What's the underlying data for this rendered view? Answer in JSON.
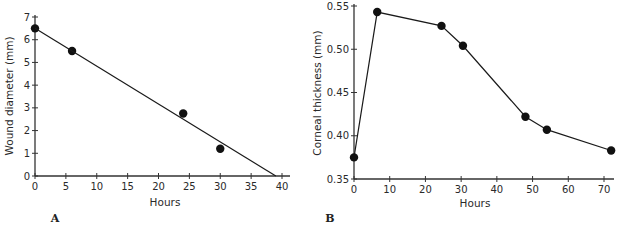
{
  "chart_data": [
    {
      "panel": "A",
      "type": "scatter",
      "title": "",
      "xlabel": "Hours",
      "ylabel": "Wound diameter (mm)",
      "xlim": [
        0,
        40
      ],
      "ylim": [
        0,
        7
      ],
      "xticks": [
        0,
        5,
        10,
        15,
        20,
        25,
        30,
        35,
        40
      ],
      "yticks": [
        0,
        1,
        2,
        3,
        4,
        5,
        6,
        7
      ],
      "grid": false,
      "series": [
        {
          "name": "Measured",
          "style": "points",
          "x": [
            0,
            6,
            24,
            30
          ],
          "y": [
            6.5,
            5.5,
            2.75,
            1.2
          ]
        },
        {
          "name": "Linear fit",
          "style": "line",
          "x": [
            0,
            39
          ],
          "y": [
            6.5,
            0
          ]
        }
      ]
    },
    {
      "panel": "B",
      "type": "line",
      "title": "",
      "xlabel": "Hours",
      "ylabel": "Corneal thickness (mm)",
      "xlim": [
        0,
        70
      ],
      "ylim": [
        0.35,
        0.55
      ],
      "xticks": [
        0,
        10,
        20,
        30,
        40,
        50,
        60,
        70
      ],
      "ytick_labels": [
        "0.35",
        "0.40",
        "0.45",
        "0.50",
        "0.55"
      ],
      "yticks": [
        0.35,
        0.4,
        0.45,
        0.5,
        0.55
      ],
      "grid": false,
      "series": [
        {
          "name": "Corneal thickness",
          "style": "line+points",
          "x": [
            0,
            6.5,
            24.5,
            30.5,
            48,
            54,
            72
          ],
          "y": [
            0.375,
            0.543,
            0.527,
            0.504,
            0.422,
            0.407,
            0.383
          ]
        }
      ]
    }
  ],
  "layout": {
    "A": {
      "left": 35,
      "right": 282,
      "top": 17,
      "bottom": 176,
      "panel_label_pos": [
        55,
        222
      ],
      "xlabel_pos": [
        165,
        206
      ],
      "ylabel_pos": [
        9,
        96
      ]
    },
    "B": {
      "left": 354,
      "right": 604,
      "top": 6,
      "bottom": 179,
      "panel_label_pos": [
        330,
        222
      ],
      "xlabel_pos": [
        475,
        207
      ],
      "ylabel_pos": [
        317,
        93
      ]
    }
  },
  "colors": {
    "ink": "#1a1a1a",
    "axis": "#333333"
  }
}
